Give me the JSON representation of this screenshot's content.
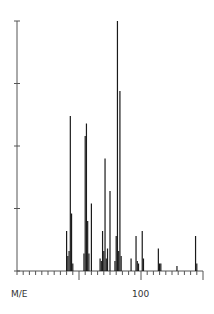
{
  "chart_data": {
    "type": "bar",
    "subtype": "mass-spectrum-stick",
    "title": "",
    "xlabel": "M/E",
    "ylabel": "",
    "xlim": [
      0,
      150
    ],
    "ylim": [
      0,
      100
    ],
    "x_tick_labels": [
      {
        "value": 100,
        "label": "100"
      }
    ],
    "x_major_ticks": [
      50,
      100,
      150
    ],
    "x_minor_tick_step": 5,
    "y_ticks": [
      0,
      25,
      50,
      75,
      100
    ],
    "grid": false,
    "legend": null,
    "peaks": [
      {
        "mz": 40,
        "intensity": 16
      },
      {
        "mz": 41,
        "intensity": 6
      },
      {
        "mz": 42,
        "intensity": 8
      },
      {
        "mz": 43,
        "intensity": 62
      },
      {
        "mz": 44,
        "intensity": 23
      },
      {
        "mz": 45,
        "intensity": 3
      },
      {
        "mz": 54,
        "intensity": 7
      },
      {
        "mz": 55,
        "intensity": 54
      },
      {
        "mz": 56,
        "intensity": 59
      },
      {
        "mz": 57,
        "intensity": 20
      },
      {
        "mz": 58,
        "intensity": 7
      },
      {
        "mz": 60,
        "intensity": 27
      },
      {
        "mz": 67,
        "intensity": 5
      },
      {
        "mz": 68,
        "intensity": 4
      },
      {
        "mz": 69,
        "intensity": 16
      },
      {
        "mz": 70,
        "intensity": 8
      },
      {
        "mz": 71,
        "intensity": 45
      },
      {
        "mz": 72,
        "intensity": 5
      },
      {
        "mz": 73,
        "intensity": 9
      },
      {
        "mz": 75,
        "intensity": 32
      },
      {
        "mz": 79,
        "intensity": 4
      },
      {
        "mz": 80,
        "intensity": 14
      },
      {
        "mz": 81,
        "intensity": 100
      },
      {
        "mz": 82,
        "intensity": 8
      },
      {
        "mz": 83,
        "intensity": 72
      },
      {
        "mz": 84,
        "intensity": 6
      },
      {
        "mz": 92,
        "intensity": 5
      },
      {
        "mz": 96,
        "intensity": 14
      },
      {
        "mz": 97,
        "intensity": 4
      },
      {
        "mz": 98,
        "intensity": 3
      },
      {
        "mz": 101,
        "intensity": 16
      },
      {
        "mz": 102,
        "intensity": 5
      },
      {
        "mz": 114,
        "intensity": 9
      },
      {
        "mz": 115,
        "intensity": 3
      },
      {
        "mz": 116,
        "intensity": 3
      },
      {
        "mz": 129,
        "intensity": 2
      },
      {
        "mz": 144,
        "intensity": 14
      },
      {
        "mz": 145,
        "intensity": 3
      }
    ]
  },
  "labels": {
    "x_axis": "M/E",
    "tick_100": "100"
  },
  "colors": {
    "axis": "#555555",
    "peak": "#1a1a1a",
    "background": "#ffffff"
  }
}
